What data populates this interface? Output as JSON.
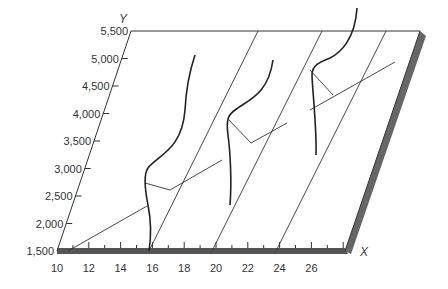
{
  "figure": {
    "axes": {
      "x": {
        "name": "X",
        "ticks": [
          "10",
          "12",
          "14",
          "16",
          "18",
          "20",
          "22",
          "24",
          "26"
        ]
      },
      "y": {
        "name": "Y",
        "ticks": [
          "1,500",
          "2,000",
          "2,500",
          "3,000",
          "3,500",
          "4,000",
          "4,500",
          "5,000",
          "5,500"
        ]
      }
    },
    "distributions_at_x": [
      16,
      20,
      24
    ],
    "colors": {
      "line": "#333333",
      "curve": "#222222",
      "shadow": "#555555",
      "background": "#ffffff"
    }
  }
}
